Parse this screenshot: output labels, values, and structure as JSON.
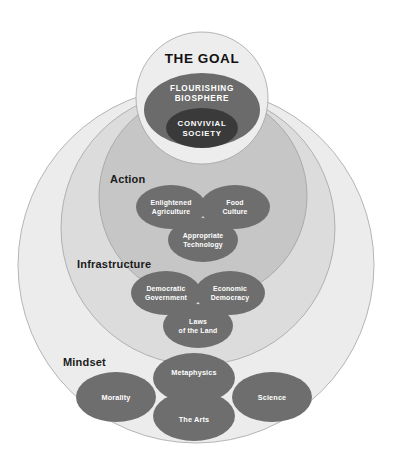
{
  "diagram": {
    "colors": {
      "background": "#ffffff",
      "mindset_band": "#ececec",
      "infrastructure_band": "#dcdcdc",
      "action_band": "#c6c6c6",
      "goal_circle": "#ededed",
      "goal_inner": "#6b6b6b",
      "goal_core": "#3a3a3a",
      "node_fill": "#6e6e6e",
      "node_text": "#ffffff",
      "tier_text": "#1b1b1b",
      "outline": "#9a9a9a"
    },
    "goal": {
      "title": "THE GOAL",
      "biosphere_line1": "FLOURISHING",
      "biosphere_line2": "BIOSPHERE",
      "society_line1": "CONVIVIAL",
      "society_line2": "SOCIETY"
    },
    "tiers": [
      {
        "id": "action",
        "label": "Action",
        "nodes": [
          {
            "id": "enlightened-agriculture",
            "line1": "Enlightened",
            "line2": "Agriculture"
          },
          {
            "id": "food-culture",
            "line1": "Food",
            "line2": "Culture"
          },
          {
            "id": "appropriate-technology",
            "line1": "Appropriate",
            "line2": "Technology"
          }
        ]
      },
      {
        "id": "infrastructure",
        "label": "Infrastructure",
        "nodes": [
          {
            "id": "democratic-government",
            "line1": "Democratic",
            "line2": "Government"
          },
          {
            "id": "economic-democracy",
            "line1": "Economic",
            "line2": "Democracy"
          },
          {
            "id": "laws-of-the-land",
            "line1": "Laws",
            "line2": "of the Land"
          }
        ]
      },
      {
        "id": "mindset",
        "label": "Mindset",
        "nodes": [
          {
            "id": "metaphysics",
            "line1": "Metaphysics",
            "line2": ""
          },
          {
            "id": "morality",
            "line1": "Morality",
            "line2": ""
          },
          {
            "id": "science",
            "line1": "Science",
            "line2": ""
          },
          {
            "id": "the-arts",
            "line1": "The Arts",
            "line2": ""
          }
        ]
      }
    ]
  }
}
